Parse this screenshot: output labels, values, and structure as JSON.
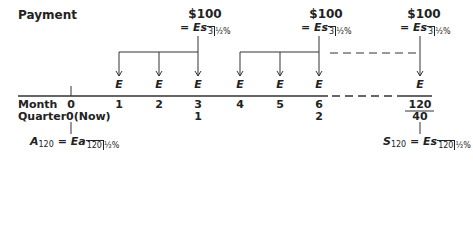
{
  "title": "Payment",
  "payments": [
    {
      "amount": "$100",
      "formula_prefix": "= ",
      "formula_main": "Es",
      "sub_n": "3",
      "sub_rate": "½%"
    },
    {
      "amount": "$100",
      "formula_prefix": "= ",
      "formula_main": "Es",
      "sub_n": "3",
      "sub_rate": "½%"
    },
    {
      "amount": "$100",
      "formula_prefix": "= ",
      "formula_main": "Es",
      "sub_n": "3",
      "sub_rate": "½%"
    }
  ],
  "deposit_label": "E",
  "rows": {
    "month_label": "Month",
    "quarter_label": "Quarter",
    "months": [
      "0",
      "1",
      "2",
      "3",
      "4",
      "5",
      "6",
      "120"
    ],
    "quarters": [
      "0(Now)",
      "1",
      "2",
      "40"
    ]
  },
  "present_value": {
    "lhs": "A",
    "lhs_sub": "120",
    "eq": " = ",
    "main": "Ea",
    "sub_n": "120",
    "sub_rate": "½%"
  },
  "future_value": {
    "lhs": "S",
    "lhs_sub": "120",
    "eq": " = ",
    "main": "Es",
    "sub_n": "120",
    "sub_rate": "½%"
  },
  "colors": {
    "line": "#333333",
    "text": "#222222"
  }
}
